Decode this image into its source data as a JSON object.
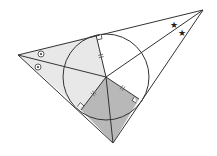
{
  "diagram": {
    "type": "triangle-incircle",
    "vertices": {
      "A": {
        "x": 18,
        "y": 55
      },
      "B": {
        "x": 203,
        "y": 10
      },
      "C": {
        "x": 113,
        "y": 143
      }
    },
    "incenter": {
      "x": 106,
      "y": 77
    },
    "incircle_radius": 43,
    "tangent_points": {
      "AB": {
        "x": 96,
        "y": 35
      },
      "BC": {
        "x": 139,
        "y": 99
      },
      "CA": {
        "x": 81,
        "y": 110
      }
    },
    "regions": [
      {
        "name": "kite-A-upper",
        "points": "18,55 96,35 106,77",
        "fill": "#e8e8e8"
      },
      {
        "name": "kite-A-lower",
        "points": "18,55 106,77 81,110",
        "fill": "#e8e8e8"
      },
      {
        "name": "kite-C",
        "points": "81,110 106,77 139,99 113,143",
        "fill": "#b8b8b8"
      },
      {
        "name": "kite-B",
        "points": "96,35 203,10 139,99 106,77",
        "fill": "#ffffff"
      }
    ],
    "angle_markers": {
      "A": {
        "symbol": "circled-dot",
        "positions": [
          {
            "x": 41,
            "y": 54
          },
          {
            "x": 38,
            "y": 67
          }
        ]
      },
      "B": {
        "symbol": "star",
        "glyph": "★",
        "positions": [
          {
            "x": 174,
            "y": 25
          },
          {
            "x": 182,
            "y": 33
          }
        ]
      }
    },
    "equal_length_ticks": [
      {
        "name": "tick-radius-AB",
        "x": 101,
        "y": 57
      },
      {
        "name": "tick-radius-CA",
        "x": 92,
        "y": 93
      },
      {
        "name": "tick-radius-BC",
        "x": 124,
        "y": 89
      }
    ],
    "right_angle_marks": [
      "AB",
      "BC",
      "CA"
    ],
    "colors": {
      "stroke": "#333333",
      "light_shade": "#e8e8e8",
      "dark_shade": "#b8b8b8",
      "background": "#ffffff"
    }
  }
}
